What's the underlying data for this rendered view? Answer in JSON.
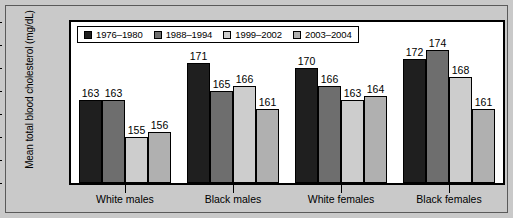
{
  "chart_data": {
    "type": "bar",
    "title": "",
    "xlabel": "",
    "ylabel": "Mean total blood cholesterol (mg/dL)",
    "ylim": [
      145,
      180
    ],
    "yticks": [
      145,
      150,
      155,
      160,
      165,
      170,
      175,
      180
    ],
    "grid": false,
    "legend_position": "top-left-inside",
    "categories": [
      "White males",
      "Black males",
      "White females",
      "Black females"
    ],
    "series": [
      {
        "name": "1976–1980",
        "color": "#1f1f1f",
        "values": [
          163,
          171,
          170,
          172
        ]
      },
      {
        "name": "1988–1994",
        "color": "#6e6e6e",
        "values": [
          163,
          165,
          166,
          174
        ]
      },
      {
        "name": "1999–2002",
        "color": "#cdcdcd",
        "values": [
          155,
          166,
          163,
          168
        ]
      },
      {
        "name": "2003–2004",
        "color": "#b0b0b0",
        "values": [
          156,
          161,
          164,
          161
        ]
      }
    ]
  },
  "figure": {
    "background_color": "#c9c9c9",
    "plot_background_color": "#ffffff",
    "border_color": "#000000"
  }
}
